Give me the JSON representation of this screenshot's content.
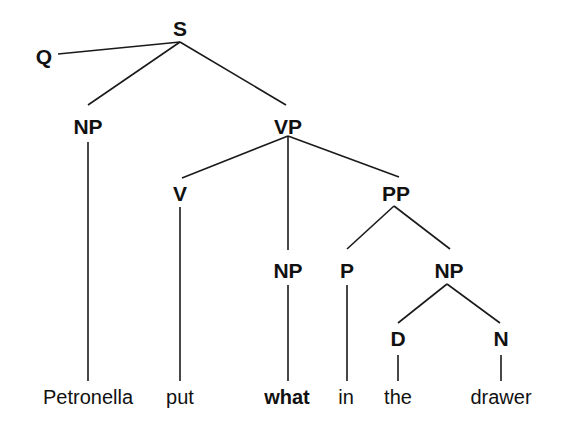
{
  "diagram": {
    "type": "syntax-tree",
    "nodes": {
      "S": {
        "label": "S",
        "x": 180,
        "y": 28
      },
      "Q": {
        "label": "Q",
        "x": 44,
        "y": 56
      },
      "NP_subj": {
        "label": "NP",
        "x": 88,
        "y": 126
      },
      "VP": {
        "label": "VP",
        "x": 288,
        "y": 126
      },
      "V": {
        "label": "V",
        "x": 180,
        "y": 193
      },
      "NP_obj": {
        "label": "NP",
        "x": 288,
        "y": 270
      },
      "PP": {
        "label": "PP",
        "x": 396,
        "y": 193
      },
      "P": {
        "label": "P",
        "x": 347,
        "y": 270
      },
      "NP_pp": {
        "label": "NP",
        "x": 449,
        "y": 270
      },
      "D": {
        "label": "D",
        "x": 398,
        "y": 338
      },
      "N": {
        "label": "N",
        "x": 501,
        "y": 338
      }
    },
    "words": [
      {
        "text": "Petronella",
        "x": 88,
        "y": 397,
        "bold": false
      },
      {
        "text": "put",
        "x": 180,
        "y": 397,
        "bold": false
      },
      {
        "text": "what",
        "x": 287,
        "y": 397,
        "bold": true
      },
      {
        "text": "in",
        "x": 346,
        "y": 397,
        "bold": false
      },
      {
        "text": "the",
        "x": 398,
        "y": 397,
        "bold": false
      },
      {
        "text": "drawer",
        "x": 501,
        "y": 397,
        "bold": false
      }
    ],
    "edges": [
      {
        "from": "S",
        "to": "Q"
      },
      {
        "from": "S",
        "to": "NP_subj"
      },
      {
        "from": "S",
        "to": "VP"
      },
      {
        "from": "NP_subj",
        "to": "Petronella"
      },
      {
        "from": "VP",
        "to": "V"
      },
      {
        "from": "VP",
        "to": "NP_obj"
      },
      {
        "from": "VP",
        "to": "PP"
      },
      {
        "from": "V",
        "to": "put"
      },
      {
        "from": "NP_obj",
        "to": "what"
      },
      {
        "from": "PP",
        "to": "P"
      },
      {
        "from": "PP",
        "to": "NP_pp"
      },
      {
        "from": "P",
        "to": "in"
      },
      {
        "from": "NP_pp",
        "to": "D"
      },
      {
        "from": "NP_pp",
        "to": "N"
      },
      {
        "from": "D",
        "to": "the"
      },
      {
        "from": "N",
        "to": "drawer"
      }
    ]
  }
}
